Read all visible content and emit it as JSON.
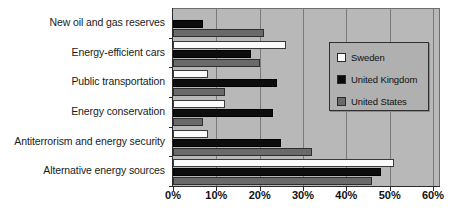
{
  "chart_data": {
    "type": "bar",
    "orientation": "horizontal",
    "title": "",
    "subtitle": "",
    "xlabel": "",
    "ylabel": "",
    "xlim": [
      0,
      60
    ],
    "xtick_labels": [
      "0%",
      "10%",
      "20%",
      "30%",
      "40%",
      "50%",
      "60%"
    ],
    "xtick_values": [
      0,
      10,
      20,
      30,
      40,
      50,
      60
    ],
    "grid": true,
    "grid_axis": "x",
    "legend_position": "upper right",
    "categories": [
      "New oil and gas reserves",
      "Energy-efficient cars",
      "Public transportation",
      "Energy conservation",
      "Antiterrorism and energy security",
      "Alternative energy sources"
    ],
    "series": [
      {
        "name": "Sweden",
        "color": "#fbfbfb",
        "values": [
          0,
          26,
          8,
          12,
          8,
          51
        ]
      },
      {
        "name": "United Kingdom",
        "color": "#0d0d0d",
        "values": [
          7,
          18,
          24,
          23,
          25,
          48
        ]
      },
      {
        "name": "United States",
        "color": "#6a6a6a",
        "values": [
          21,
          20,
          12,
          7,
          32,
          46
        ]
      }
    ],
    "annotations": []
  },
  "legend": {
    "items": [
      {
        "label": "Sweden",
        "swatch": "sweden"
      },
      {
        "label": "United Kingdom",
        "swatch": "uk"
      },
      {
        "label": "United States",
        "swatch": "us"
      }
    ]
  }
}
